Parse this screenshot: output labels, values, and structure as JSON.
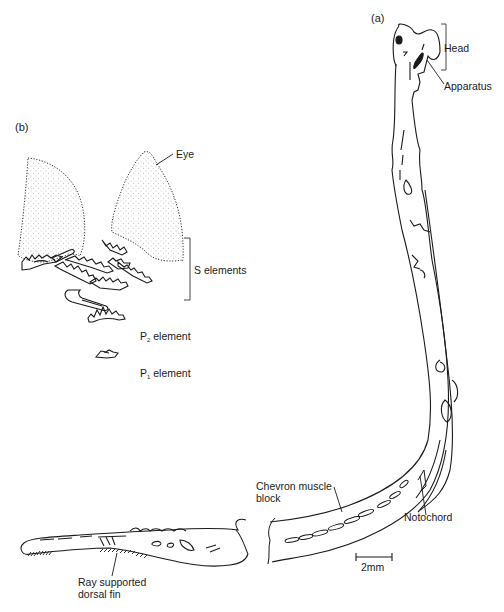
{
  "figure": {
    "panels": [
      {
        "id": "a",
        "label": "(a)"
      },
      {
        "id": "b",
        "label": "(b)"
      }
    ],
    "panel_a_labels": {
      "head": "Head",
      "apparatus": "Apparatus",
      "chevron_muscle_block_line1": "Chevron muscle",
      "chevron_muscle_block_line2": "block",
      "notochord": "Notochord",
      "ray_fin_line1": "Ray supported",
      "ray_fin_line2": "dorsal fin"
    },
    "panel_b_labels": {
      "eye": "Eye",
      "s_elements": "S elements",
      "p2_prefix": "P",
      "p2_sub": "2",
      "p2_suffix": " element",
      "p1_prefix": "P",
      "p1_sub": "1",
      "p1_suffix": " element"
    },
    "scale_bar": {
      "label": "2mm",
      "length_mm": 2
    },
    "caption_clipped": ""
  },
  "colors": {
    "ink": "#1a1a1a",
    "eye_stipple": "#9a9a9a",
    "background": "#ffffff"
  }
}
